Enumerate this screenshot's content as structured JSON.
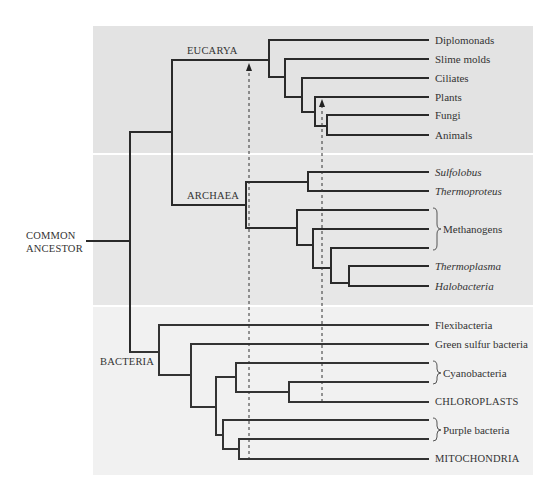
{
  "diagram": {
    "type": "phylogenetic-tree",
    "root_label": [
      "COMMON",
      "ANCESTOR"
    ],
    "colors": {
      "eucarya_band": "#e3e3e3",
      "archaea_band": "#e7e7e7",
      "bacteria_band": "#f1f1f1",
      "branch": "#2a2a2a",
      "text": "#333333"
    },
    "domains": [
      {
        "name": "EUCARYA",
        "taxa": [
          "Diplomonads",
          "Slime molds",
          "Ciliates",
          "Plants",
          "Fungi",
          "Animals"
        ]
      },
      {
        "name": "ARCHAEA",
        "taxa": [
          "Sulfolobus",
          "Thermoproteus",
          "Methanogens",
          "Thermoplasma",
          "Halobacteria"
        ]
      },
      {
        "name": "BACTERIA",
        "taxa": [
          "Flexibacteria",
          "Green sulfur bacteria",
          "Cyanobacteria",
          "CHLOROPLASTS",
          "Purple bacteria",
          "MITOCHONDRIA"
        ]
      }
    ],
    "labels": {
      "eucarya": "EUCARYA",
      "archaea": "ARCHAEA",
      "bacteria": "BACTERIA",
      "diplomonads": "Diplomonads",
      "slime_molds": "Slime molds",
      "ciliates": "Ciliates",
      "plants": "Plants",
      "fungi": "Fungi",
      "animals": "Animals",
      "sulfolobus": "Sulfolobus",
      "thermoproteus": "Thermoproteus",
      "methanogens": "Methanogens",
      "thermoplasma": "Thermoplasma",
      "halobacteria": "Halobacteria",
      "flexibacteria": "Flexibacteria",
      "green_sulfur": "Green sulfur bacteria",
      "cyanobacteria": "Cyanobacteria",
      "chloroplasts": "CHLOROPLASTS",
      "purple_bacteria": "Purple bacteria",
      "mitochondria": "MITOCHONDRIA"
    },
    "endosymbiosis_arrows": [
      {
        "from": "MITOCHONDRIA",
        "to": "EUCARYA stem",
        "style": "dashed"
      },
      {
        "from": "CHLOROPLASTS",
        "to": "Plants lineage",
        "style": "dashed"
      }
    ]
  }
}
